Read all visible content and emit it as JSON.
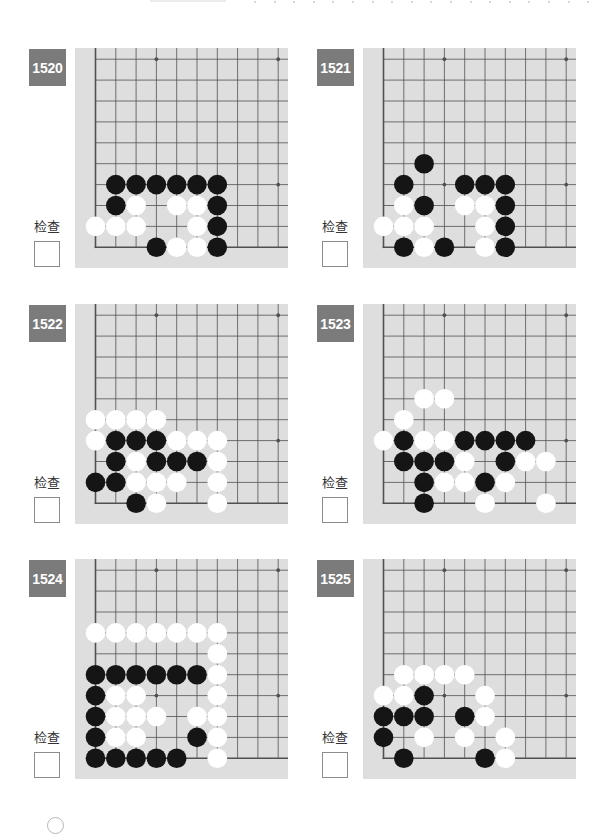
{
  "page": {
    "background": "#ffffff"
  },
  "board_style": {
    "board_bg": "#dedede",
    "line_color": "#505050",
    "black_stone": "#151515",
    "white_stone": "#ffffff",
    "badge_bg": "#7b7b7b",
    "badge_text": "#ffffff"
  },
  "grid": {
    "cols": 10,
    "rows": 10
  },
  "star_points": [
    [
      3,
      3
    ],
    [
      3,
      9
    ],
    [
      9,
      3
    ],
    [
      9,
      9
    ]
  ],
  "problems": [
    {
      "number": "1520",
      "check_label": "检查",
      "checked": false,
      "stones": {
        "black": [
          [
            1,
            3
          ],
          [
            2,
            3
          ],
          [
            3,
            3
          ],
          [
            4,
            3
          ],
          [
            5,
            3
          ],
          [
            6,
            3
          ],
          [
            1,
            2
          ],
          [
            6,
            2
          ],
          [
            6,
            1
          ],
          [
            3,
            0
          ],
          [
            6,
            0
          ]
        ],
        "white": [
          [
            2,
            2
          ],
          [
            4,
            2
          ],
          [
            5,
            2
          ],
          [
            0,
            1
          ],
          [
            1,
            1
          ],
          [
            2,
            1
          ],
          [
            5,
            1
          ],
          [
            4,
            0
          ],
          [
            5,
            0
          ]
        ]
      }
    },
    {
      "number": "1521",
      "check_label": "检查",
      "checked": false,
      "stones": {
        "black": [
          [
            2,
            4
          ],
          [
            1,
            3
          ],
          [
            4,
            3
          ],
          [
            5,
            3
          ],
          [
            6,
            3
          ],
          [
            2,
            2
          ],
          [
            6,
            2
          ],
          [
            6,
            1
          ],
          [
            1,
            0
          ],
          [
            3,
            0
          ],
          [
            6,
            0
          ]
        ],
        "white": [
          [
            1,
            2
          ],
          [
            4,
            2
          ],
          [
            5,
            2
          ],
          [
            0,
            1
          ],
          [
            1,
            1
          ],
          [
            2,
            1
          ],
          [
            5,
            1
          ],
          [
            2,
            0
          ],
          [
            5,
            0
          ]
        ]
      }
    },
    {
      "number": "1522",
      "check_label": "检查",
      "checked": false,
      "stones": {
        "black": [
          [
            1,
            3
          ],
          [
            2,
            3
          ],
          [
            3,
            3
          ],
          [
            1,
            2
          ],
          [
            3,
            2
          ],
          [
            4,
            2
          ],
          [
            5,
            2
          ],
          [
            0,
            1
          ],
          [
            1,
            1
          ],
          [
            2,
            0
          ]
        ],
        "white": [
          [
            0,
            4
          ],
          [
            1,
            4
          ],
          [
            2,
            4
          ],
          [
            3,
            4
          ],
          [
            0,
            3
          ],
          [
            4,
            3
          ],
          [
            5,
            3
          ],
          [
            6,
            3
          ],
          [
            2,
            2
          ],
          [
            6,
            2
          ],
          [
            2,
            1
          ],
          [
            3,
            1
          ],
          [
            4,
            1
          ],
          [
            6,
            1
          ],
          [
            3,
            0
          ],
          [
            6,
            0
          ]
        ]
      }
    },
    {
      "number": "1523",
      "check_label": "检查",
      "checked": false,
      "stones": {
        "black": [
          [
            1,
            3
          ],
          [
            4,
            3
          ],
          [
            5,
            3
          ],
          [
            6,
            3
          ],
          [
            7,
            3
          ],
          [
            1,
            2
          ],
          [
            2,
            2
          ],
          [
            3,
            2
          ],
          [
            6,
            2
          ],
          [
            2,
            1
          ],
          [
            5,
            1
          ],
          [
            2,
            0
          ]
        ],
        "white": [
          [
            2,
            5
          ],
          [
            3,
            5
          ],
          [
            1,
            4
          ],
          [
            0,
            3
          ],
          [
            2,
            3
          ],
          [
            3,
            3
          ],
          [
            4,
            2
          ],
          [
            7,
            2
          ],
          [
            8,
            2
          ],
          [
            3,
            1
          ],
          [
            4,
            1
          ],
          [
            6,
            1
          ],
          [
            5,
            0
          ],
          [
            8,
            0
          ]
        ]
      }
    },
    {
      "number": "1524",
      "check_label": "检查",
      "checked": false,
      "stones": {
        "black": [
          [
            0,
            4
          ],
          [
            1,
            4
          ],
          [
            2,
            4
          ],
          [
            3,
            4
          ],
          [
            4,
            4
          ],
          [
            5,
            4
          ],
          [
            0,
            3
          ],
          [
            0,
            2
          ],
          [
            0,
            1
          ],
          [
            5,
            1
          ],
          [
            0,
            0
          ],
          [
            1,
            0
          ],
          [
            2,
            0
          ],
          [
            3,
            0
          ],
          [
            4,
            0
          ]
        ],
        "white": [
          [
            0,
            6
          ],
          [
            1,
            6
          ],
          [
            2,
            6
          ],
          [
            3,
            6
          ],
          [
            4,
            6
          ],
          [
            5,
            6
          ],
          [
            6,
            6
          ],
          [
            6,
            5
          ],
          [
            6,
            4
          ],
          [
            1,
            3
          ],
          [
            2,
            3
          ],
          [
            6,
            3
          ],
          [
            1,
            2
          ],
          [
            2,
            2
          ],
          [
            3,
            2
          ],
          [
            5,
            2
          ],
          [
            6,
            2
          ],
          [
            1,
            1
          ],
          [
            2,
            1
          ],
          [
            6,
            1
          ],
          [
            6,
            0
          ]
        ]
      }
    },
    {
      "number": "1525",
      "check_label": "检查",
      "checked": false,
      "stones": {
        "black": [
          [
            2,
            3
          ],
          [
            0,
            2
          ],
          [
            1,
            2
          ],
          [
            2,
            2
          ],
          [
            4,
            2
          ],
          [
            0,
            1
          ],
          [
            1,
            0
          ],
          [
            5,
            0
          ]
        ],
        "white": [
          [
            1,
            4
          ],
          [
            2,
            4
          ],
          [
            3,
            4
          ],
          [
            4,
            4
          ],
          [
            0,
            3
          ],
          [
            1,
            3
          ],
          [
            5,
            3
          ],
          [
            5,
            2
          ],
          [
            2,
            1
          ],
          [
            4,
            1
          ],
          [
            6,
            1
          ],
          [
            6,
            0
          ]
        ]
      }
    }
  ]
}
